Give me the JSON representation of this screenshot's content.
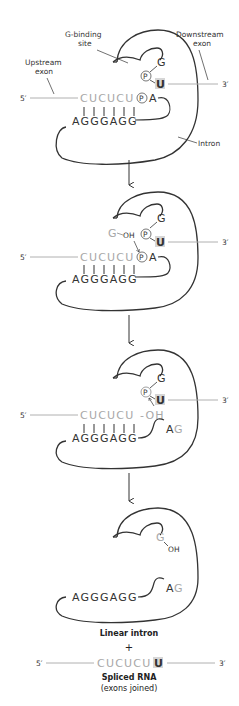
{
  "colors": {
    "intron": "#333333",
    "exon": "#a8a8a8",
    "u_highlight": "#d6d6d6",
    "background": "#ffffff"
  },
  "labels": {
    "g_binding_site_line1": "G-binding",
    "g_binding_site_line2": "site",
    "downstream_exon_line1": "Downstream",
    "downstream_exon_line2": "exon",
    "upstream_exon_line1": "Upstream",
    "upstream_exon_line2": "exon",
    "intron": "Intron",
    "five_prime": "5′",
    "three_prime": "3′"
  },
  "sequences": {
    "upstream_exon": "CUCUCU",
    "intron_pairing": "AGGGAGG",
    "downstream_nt": "U",
    "phosphate": "P",
    "adenine": "A",
    "guanine": "G",
    "hydroxyl": "OH",
    "ag": "A",
    "ag_g": "G",
    "oh_dash": "-OH"
  },
  "steps": [
    {
      "name": "step-1-initial-complex"
    },
    {
      "name": "step-2-guanosine-attack"
    },
    {
      "name": "step-3-exon-attack"
    },
    {
      "name": "step-4-products"
    }
  ],
  "products": {
    "linear_intron": "Linear intron",
    "plus": "+",
    "spliced_seq": "CUCUCU",
    "spliced_u": "U",
    "spliced_rna": "Spliced RNA",
    "exons_joined": "(exons joined)"
  }
}
